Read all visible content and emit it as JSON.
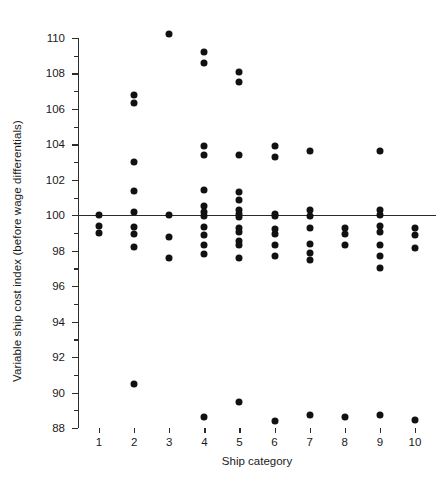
{
  "chart_data": {
    "type": "scatter",
    "title": "",
    "xlabel": "Ship category",
    "ylabel": "Variable ship cost index (before wage differentials)",
    "xlim": [
      0.4,
      10.6
    ],
    "ylim": [
      88,
      110
    ],
    "yticks": [
      88,
      90,
      92,
      94,
      96,
      98,
      100,
      102,
      104,
      106,
      108,
      110
    ],
    "ytick_labels": [
      "88",
      "90",
      "92",
      "94",
      "96",
      "98",
      "100",
      "102",
      "104",
      "106",
      "108",
      "110"
    ],
    "yticks_minor": [
      89,
      91,
      93,
      95,
      97,
      99,
      101,
      103,
      105,
      107,
      109
    ],
    "xticks": [
      1,
      2,
      3,
      4,
      5,
      6,
      7,
      8,
      9,
      10
    ],
    "xtick_labels": [
      "1",
      "2",
      "3",
      "4",
      "5",
      "6",
      "7",
      "8",
      "9",
      "10"
    ],
    "grid": false,
    "legend": null,
    "reference_line": {
      "axis": "y",
      "value": 100,
      "label": "100 index reference line"
    },
    "marker": {
      "shape": "circle",
      "color": "#111111",
      "size": 7
    },
    "series": [
      {
        "name": "Variable ship cost index",
        "points": [
          {
            "x": 1,
            "y": 100.0
          },
          {
            "x": 1,
            "y": 99.4
          },
          {
            "x": 1,
            "y": 99.0
          },
          {
            "x": 2,
            "y": 106.8
          },
          {
            "x": 2,
            "y": 106.35
          },
          {
            "x": 2,
            "y": 103.0
          },
          {
            "x": 2,
            "y": 101.35
          },
          {
            "x": 2,
            "y": 100.2
          },
          {
            "x": 2,
            "y": 99.35
          },
          {
            "x": 2,
            "y": 98.95
          },
          {
            "x": 2,
            "y": 98.2
          },
          {
            "x": 2,
            "y": 90.5
          },
          {
            "x": 3,
            "y": 110.25
          },
          {
            "x": 3,
            "y": 100.0
          },
          {
            "x": 3,
            "y": 98.75
          },
          {
            "x": 3,
            "y": 97.6
          },
          {
            "x": 4,
            "y": 109.2
          },
          {
            "x": 4,
            "y": 108.6
          },
          {
            "x": 4,
            "y": 103.9
          },
          {
            "x": 4,
            "y": 103.4
          },
          {
            "x": 4,
            "y": 101.45
          },
          {
            "x": 4,
            "y": 100.5
          },
          {
            "x": 4,
            "y": 100.2
          },
          {
            "x": 4,
            "y": 99.95
          },
          {
            "x": 4,
            "y": 99.35
          },
          {
            "x": 4,
            "y": 98.9
          },
          {
            "x": 4,
            "y": 98.3
          },
          {
            "x": 4,
            "y": 97.8
          },
          {
            "x": 4,
            "y": 88.6
          },
          {
            "x": 5,
            "y": 108.1
          },
          {
            "x": 5,
            "y": 107.5
          },
          {
            "x": 5,
            "y": 103.4
          },
          {
            "x": 5,
            "y": 101.3
          },
          {
            "x": 5,
            "y": 100.85
          },
          {
            "x": 5,
            "y": 100.3
          },
          {
            "x": 5,
            "y": 100.1
          },
          {
            "x": 5,
            "y": 99.9
          },
          {
            "x": 5,
            "y": 99.3
          },
          {
            "x": 5,
            "y": 99.05
          },
          {
            "x": 5,
            "y": 98.55
          },
          {
            "x": 5,
            "y": 98.3
          },
          {
            "x": 5,
            "y": 97.6
          },
          {
            "x": 5,
            "y": 89.45
          },
          {
            "x": 6,
            "y": 103.9
          },
          {
            "x": 6,
            "y": 103.3
          },
          {
            "x": 6,
            "y": 100.05
          },
          {
            "x": 6,
            "y": 99.95
          },
          {
            "x": 6,
            "y": 99.25
          },
          {
            "x": 6,
            "y": 98.95
          },
          {
            "x": 6,
            "y": 98.3
          },
          {
            "x": 6,
            "y": 97.7
          },
          {
            "x": 6,
            "y": 88.4
          },
          {
            "x": 7,
            "y": 103.6
          },
          {
            "x": 7,
            "y": 100.3
          },
          {
            "x": 7,
            "y": 99.95
          },
          {
            "x": 7,
            "y": 99.3
          },
          {
            "x": 7,
            "y": 98.4
          },
          {
            "x": 7,
            "y": 97.85
          },
          {
            "x": 7,
            "y": 97.5
          },
          {
            "x": 7,
            "y": 88.75
          },
          {
            "x": 8,
            "y": 99.3
          },
          {
            "x": 8,
            "y": 98.95
          },
          {
            "x": 8,
            "y": 98.3
          },
          {
            "x": 8,
            "y": 88.6
          },
          {
            "x": 9,
            "y": 103.65
          },
          {
            "x": 9,
            "y": 100.3
          },
          {
            "x": 9,
            "y": 100.0
          },
          {
            "x": 9,
            "y": 99.4
          },
          {
            "x": 9,
            "y": 99.05
          },
          {
            "x": 9,
            "y": 98.3
          },
          {
            "x": 9,
            "y": 97.7
          },
          {
            "x": 9,
            "y": 97.0
          },
          {
            "x": 9,
            "y": 88.75
          },
          {
            "x": 10,
            "y": 99.3
          },
          {
            "x": 10,
            "y": 98.9
          },
          {
            "x": 10,
            "y": 98.15
          },
          {
            "x": 10,
            "y": 88.45
          }
        ]
      }
    ]
  }
}
